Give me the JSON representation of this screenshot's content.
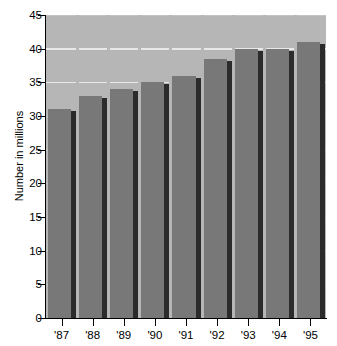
{
  "chart_data": {
    "type": "bar",
    "title": "",
    "subtitle": "",
    "xlabel": "",
    "ylabel": "Number in millions",
    "categories": [
      "'87",
      "'88",
      "'89",
      "'90",
      "'91",
      "'92",
      "'93",
      "'94",
      "'95"
    ],
    "values": [
      31,
      33,
      34,
      35,
      36,
      38.5,
      40,
      40,
      41
    ],
    "series": [
      {
        "name": "Number in millions",
        "values": [
          31,
          33,
          34,
          35,
          36,
          38.5,
          40,
          40,
          41
        ]
      }
    ],
    "ylim": [
      0,
      45
    ],
    "ytick_values": [
      0,
      5,
      10,
      15,
      20,
      25,
      30,
      35,
      40,
      45
    ],
    "ytick_labels": [
      "0",
      "5",
      "10",
      "15",
      "20",
      "25",
      "30",
      "35",
      "40",
      "45"
    ],
    "xtick_labels": [
      "'87",
      "'88",
      "'89",
      "'90",
      "'91",
      "'92",
      "'93",
      "'94",
      "'95"
    ],
    "grid": true,
    "gridlines_at": [
      35,
      40
    ],
    "legend": null,
    "legend_position": "none",
    "annotations": [],
    "colors": {
      "bar_face": "#787878",
      "bar_shadow": "#2b2b2b",
      "plot_background": "#b6b6b6",
      "gridline": "#e8e8e8",
      "axis": "#000000",
      "text": "#000000",
      "page_background": "#ffffff"
    }
  }
}
